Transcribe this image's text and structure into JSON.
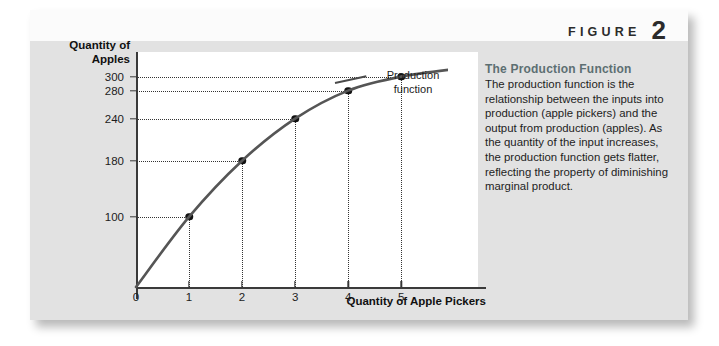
{
  "figure": {
    "word": "FIGURE",
    "number": "2"
  },
  "caption": {
    "title": "The Production Function",
    "body": "The production function is the relationship between the inputs into production (apple pickers) and the output from production (apples). As the quantity of the input increases, the production function gets flatter, reflecting the property of diminishing marginal product."
  },
  "chart_data": {
    "type": "line",
    "title": "",
    "xlabel": "Quantity of Apple Pickers",
    "ylabel": "Quantity of Apples",
    "series_label": "Production function",
    "x": [
      0,
      1,
      2,
      3,
      4,
      5
    ],
    "values": [
      0,
      100,
      180,
      240,
      280,
      300
    ],
    "xticks": [
      "0",
      "1",
      "2",
      "3",
      "4",
      "5"
    ],
    "yticks": [
      "100",
      "180",
      "240",
      "280",
      "300"
    ],
    "ytick_values": [
      100,
      180,
      240,
      280,
      300
    ],
    "xlim": [
      0,
      6.6
    ],
    "ylim": [
      0,
      335
    ],
    "grid": false,
    "legend": "none",
    "annotations": [
      "Production function"
    ],
    "curve_color": "#555555",
    "point_color": "#111111"
  }
}
